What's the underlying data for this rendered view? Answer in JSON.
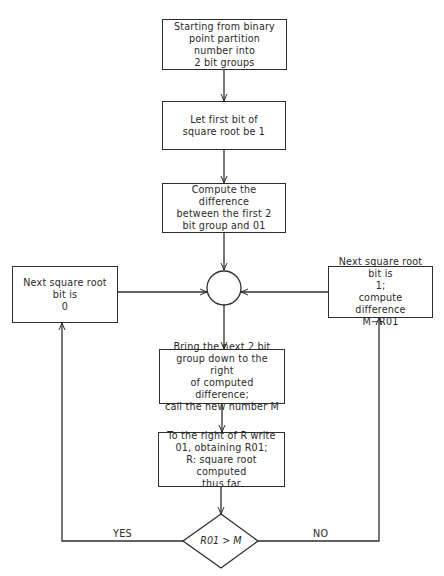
{
  "diagram": {
    "type": "flowchart",
    "title": "",
    "nodes": [
      {
        "id": "start",
        "shape": "rect",
        "text": "Starting from binary\npoint partition\nnumber into\n2 bit groups"
      },
      {
        "id": "first_bit",
        "shape": "rect",
        "text": "Let first bit of\nsquare root be 1"
      },
      {
        "id": "first_diff",
        "shape": "rect",
        "text": "Compute the difference\nbetween the first 2\nbit group and 01"
      },
      {
        "id": "junction",
        "shape": "circle",
        "text": ""
      },
      {
        "id": "bring_down",
        "shape": "rect",
        "text": "Bring the next 2 bit\ngroup down to the right\nof computed difference;\ncall the new number M"
      },
      {
        "id": "write_r01",
        "shape": "rect",
        "text": "To the right of R write\n01, obtaining R01;\nR: square root computed\nthus far"
      },
      {
        "id": "decision",
        "shape": "diamond",
        "text": "R01 > M"
      },
      {
        "id": "bit_zero",
        "shape": "rect",
        "text": "Next square root bit is\n0"
      },
      {
        "id": "bit_one",
        "shape": "rect",
        "text": "Next square root bit is\n1;\ncompute difference\nM−R01"
      }
    ],
    "edges": [
      {
        "from": "start",
        "to": "first_bit",
        "label": ""
      },
      {
        "from": "first_bit",
        "to": "first_diff",
        "label": ""
      },
      {
        "from": "first_diff",
        "to": "junction",
        "label": ""
      },
      {
        "from": "junction",
        "to": "bring_down",
        "label": ""
      },
      {
        "from": "bring_down",
        "to": "write_r01",
        "label": ""
      },
      {
        "from": "write_r01",
        "to": "decision",
        "label": ""
      },
      {
        "from": "decision",
        "to": "bit_zero",
        "label": "YES"
      },
      {
        "from": "decision",
        "to": "bit_one",
        "label": "NO"
      },
      {
        "from": "bit_zero",
        "to": "junction",
        "label": ""
      },
      {
        "from": "bit_one",
        "to": "junction",
        "label": ""
      }
    ],
    "labels": {
      "yes": "YES",
      "no": "NO"
    },
    "colors": {
      "stroke": "#2e2e2e",
      "background": "#ffffff",
      "text": "#2a2a2a"
    }
  }
}
